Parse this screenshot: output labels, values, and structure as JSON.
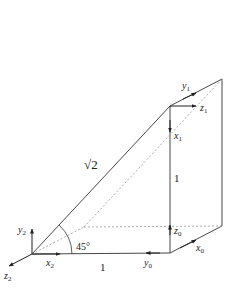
{
  "diagram": {
    "type": "3d-wedge-coordinate-frames",
    "labels": {
      "sqrt2": "√2",
      "vertical_one": "1",
      "base_one": "1",
      "angle": "45°"
    },
    "frames": {
      "frame0": {
        "x": "x",
        "x_sub": "0",
        "y": "y",
        "y_sub": "0",
        "z": "z",
        "z_sub": "0"
      },
      "frame1": {
        "x": "x",
        "x_sub": "1",
        "y": "y",
        "y_sub": "1",
        "z": "z",
        "z_sub": "1"
      },
      "frame2": {
        "x": "x",
        "x_sub": "2",
        "y": "y",
        "y_sub": "2",
        "z": "z",
        "z_sub": "2"
      }
    },
    "colors": {
      "line": "#333333",
      "dotted": "#999999"
    }
  }
}
